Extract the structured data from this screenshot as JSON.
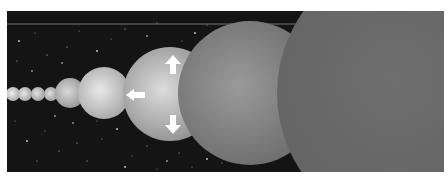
{
  "image": {
    "description": "Grayscale illustration of a row of spheres growing in size from left to right against a starry black sky; the middle sphere carries three white arrows pointing up, left and down.",
    "colors": {
      "background": "#141414",
      "star": "#d8d8d8",
      "arrow": "#ffffff",
      "horizon_line": "#8a8a8a"
    },
    "spheres": [
      {
        "id": "tiny-1",
        "cx": 6,
        "cy": 83,
        "r": 7,
        "light": "#ececec",
        "dark": "#a8a8a8"
      },
      {
        "id": "tiny-2",
        "cx": 18,
        "cy": 83,
        "r": 7,
        "light": "#e6e6e6",
        "dark": "#a0a0a0"
      },
      {
        "id": "tiny-3",
        "cx": 31,
        "cy": 83,
        "r": 7,
        "light": "#e2e2e2",
        "dark": "#9c9c9c"
      },
      {
        "id": "tiny-4",
        "cx": 44,
        "cy": 83,
        "r": 7,
        "light": "#dedede",
        "dark": "#989898"
      },
      {
        "id": "small",
        "cx": 63,
        "cy": 82,
        "r": 15,
        "light": "#d8d8d8",
        "dark": "#959595"
      },
      {
        "id": "medium",
        "cx": 97,
        "cy": 82,
        "r": 26,
        "light": "#e8e8e8",
        "dark": "#a5a5a5"
      },
      {
        "id": "arrow-sphere",
        "cx": 163,
        "cy": 83,
        "r": 47,
        "light": "#dcdcdc",
        "dark": "#8e8e8e"
      },
      {
        "id": "large",
        "cx": 243,
        "cy": 82,
        "r": 72,
        "light": "#9a9a9a",
        "dark": "#6c6c6c"
      },
      {
        "id": "giant",
        "cx": 410,
        "cy": 82,
        "r": 140,
        "light": "#6e6e6e",
        "dark": "#626262"
      }
    ],
    "arrows": [
      {
        "id": "arrow-up",
        "direction": "up"
      },
      {
        "id": "arrow-left",
        "direction": "left"
      },
      {
        "id": "arrow-down",
        "direction": "down"
      }
    ],
    "stars": [
      [
        12,
        30
      ],
      [
        28,
        22
      ],
      [
        40,
        44
      ],
      [
        25,
        60
      ],
      [
        60,
        36
      ],
      [
        72,
        20
      ],
      [
        90,
        40
      ],
      [
        104,
        28
      ],
      [
        118,
        18
      ],
      [
        140,
        25
      ],
      [
        150,
        12
      ],
      [
        175,
        30
      ],
      [
        188,
        22
      ],
      [
        200,
        14
      ],
      [
        132,
        48
      ],
      [
        55,
        52
      ],
      [
        10,
        50
      ],
      [
        8,
        110
      ],
      [
        20,
        130
      ],
      [
        38,
        120
      ],
      [
        52,
        140
      ],
      [
        66,
        112
      ],
      [
        80,
        150
      ],
      [
        95,
        128
      ],
      [
        110,
        118
      ],
      [
        125,
        145
      ],
      [
        140,
        135
      ],
      [
        160,
        150
      ],
      [
        172,
        142
      ],
      [
        185,
        156
      ],
      [
        200,
        148
      ],
      [
        215,
        152
      ],
      [
        30,
        150
      ],
      [
        48,
        105
      ],
      [
        70,
        132
      ],
      [
        90,
        110
      ],
      [
        118,
        156
      ],
      [
        150,
        158
      ]
    ]
  }
}
